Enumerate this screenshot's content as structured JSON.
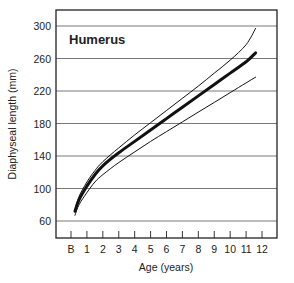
{
  "chart_data": {
    "type": "line",
    "title": "Humerus",
    "xlabel": "Age (years)",
    "ylabel": "Diaphyseal length (mm)",
    "x_tick_labels": [
      "B",
      "1",
      "2",
      "3",
      "4",
      "5",
      "6",
      "7",
      "8",
      "9",
      "10",
      "11",
      "12"
    ],
    "y_tick_labels": [
      "60",
      "100",
      "140",
      "180",
      "220",
      "260",
      "300"
    ],
    "ylim": [
      40,
      320
    ],
    "xlim": [
      -1,
      13
    ],
    "grid": "horizontal",
    "series": [
      {
        "name": "Upper bound",
        "style": "thin",
        "x": [
          0.25,
          0.5,
          1,
          1.5,
          2,
          3,
          4,
          5,
          6,
          7,
          8,
          9,
          10,
          11,
          11.6
        ],
        "values": [
          74,
          90,
          108,
          122,
          133,
          150,
          166,
          181,
          196,
          211,
          226,
          242,
          258,
          277,
          297
        ]
      },
      {
        "name": "Mean",
        "style": "thick",
        "x": [
          0.25,
          0.5,
          1,
          1.5,
          2,
          3,
          4,
          5,
          6,
          7,
          8,
          9,
          10,
          11,
          11.6
        ],
        "values": [
          72,
          86,
          103,
          117,
          128,
          144,
          158,
          172,
          186,
          200,
          214,
          228,
          242,
          256,
          267
        ]
      },
      {
        "name": "Lower bound",
        "style": "thin",
        "x": [
          0.25,
          0.5,
          1,
          1.5,
          2,
          3,
          4,
          5,
          6,
          7,
          8,
          9,
          10,
          11,
          11.6
        ],
        "values": [
          67,
          80,
          95,
          108,
          117,
          132,
          145,
          158,
          170,
          182,
          194,
          206,
          218,
          230,
          237
        ]
      }
    ]
  }
}
